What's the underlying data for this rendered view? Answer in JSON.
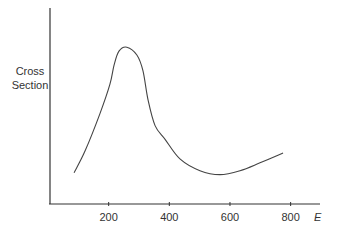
{
  "chart_data": {
    "type": "line",
    "title": "",
    "xlabel": "E",
    "ylabel": "Cross Section",
    "ylabel_lines": [
      "Cross",
      "Section"
    ],
    "x_ticks": [
      200,
      400,
      600,
      800
    ],
    "x_tick_labels": [
      "200",
      "400",
      "600",
      "800"
    ],
    "xlim": [
      0,
      880
    ],
    "ylim": [
      0,
      100
    ],
    "y_ticks": [],
    "grid": false,
    "legend": null,
    "series": [
      {
        "name": "Cross Section",
        "x": [
          86,
          122,
          171,
          204,
          218,
          234,
          260,
          293,
          313,
          330,
          353,
          386,
          435,
          501,
          567,
          633,
          699,
          775
        ],
        "y": [
          16,
          27,
          46,
          61,
          71,
          78,
          80,
          76,
          68,
          53,
          40,
          33,
          23,
          17,
          15,
          17,
          21,
          26
        ]
      }
    ],
    "annotations": []
  }
}
